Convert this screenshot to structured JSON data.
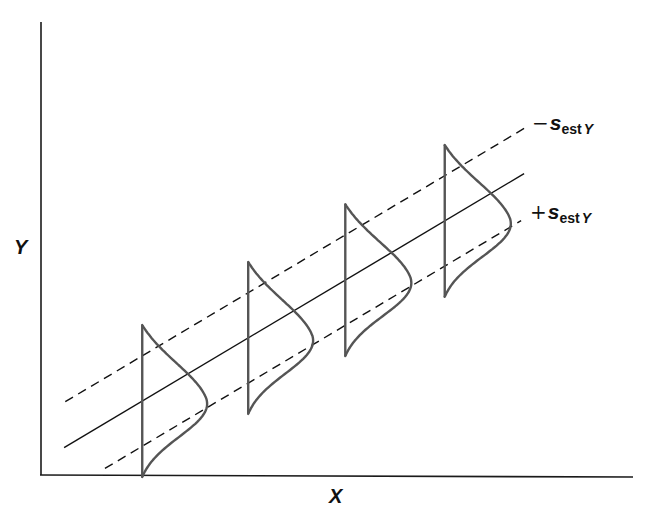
{
  "chart_data": {
    "type": "line",
    "title": "",
    "xlabel": "X",
    "ylabel": "Y",
    "xlim": [
      0,
      10
    ],
    "ylim": [
      0,
      10
    ],
    "grid": false,
    "ticks": false,
    "regression": {
      "name": "regression line",
      "intercept": 0.28,
      "slope": 0.78,
      "x_range": [
        0.39,
        8.16
      ],
      "style": "solid"
    },
    "bands": [
      {
        "name": "minus-s-est-y",
        "offset": 1.0,
        "x_range": [
          0.41,
          8.18
        ],
        "style": "dashed",
        "label_sign": "−",
        "label_symbol": "s",
        "label_subscript": "est",
        "label_subscript_var": "Y"
      },
      {
        "name": "plus-s-est-y",
        "offset": -1.0,
        "x_range": [
          1.08,
          8.11
        ],
        "style": "dashed",
        "label_sign": "+",
        "label_symbol": "s",
        "label_subscript": "est",
        "label_subscript_var": "Y"
      }
    ],
    "distributions": [
      {
        "x": 1.71,
        "half_span": 1.68,
        "peak_width": 1.1
      },
      {
        "x": 3.5,
        "half_span": 1.68,
        "peak_width": 1.1
      },
      {
        "x": 5.14,
        "half_span": 1.68,
        "peak_width": 1.12
      },
      {
        "x": 6.82,
        "half_span": 1.68,
        "peak_width": 1.12
      }
    ],
    "colors": {
      "axes": "#1a1a1a",
      "lines": "#111111",
      "distributions": "#555555"
    }
  }
}
